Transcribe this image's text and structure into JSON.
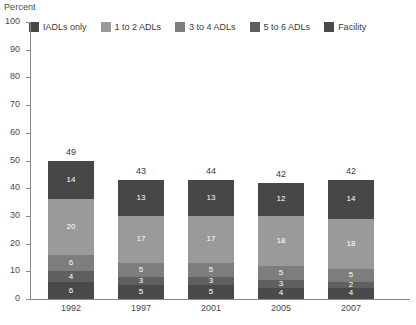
{
  "chart_data": {
    "type": "bar",
    "subtype": "stacked-bar",
    "title": "",
    "xlabel": "",
    "ylabel": "Percent",
    "ylim": [
      0,
      100
    ],
    "ytick_step": 10,
    "yticks": [
      100,
      90,
      80,
      70,
      60,
      50,
      40,
      30,
      20,
      10,
      0
    ],
    "grid": false,
    "legend_position": "top",
    "categories": [
      "1992",
      "1997",
      "2001",
      "2005",
      "2007"
    ],
    "totals": [
      49,
      43,
      44,
      42,
      42
    ],
    "series": [
      {
        "name": "Facility",
        "color": "#4a4a4a",
        "values": [
          6,
          5,
          5,
          4,
          4
        ]
      },
      {
        "name": "5 to 6 ADLs",
        "color": "#5f5f5f",
        "values": [
          4,
          3,
          3,
          3,
          2
        ]
      },
      {
        "name": "3 to 4 ADLs",
        "color": "#7d7d7d",
        "values": [
          6,
          5,
          5,
          5,
          5
        ]
      },
      {
        "name": "1 to 2 ADLs",
        "color": "#9a9a9a",
        "values": [
          20,
          17,
          17,
          18,
          18
        ]
      },
      {
        "name": "IADLs only",
        "color": "#474747",
        "values": [
          14,
          13,
          13,
          12,
          14
        ]
      }
    ]
  },
  "legend": {
    "items": [
      {
        "label": "IADLs only",
        "color": "#474747"
      },
      {
        "label": "1 to 2 ADLs",
        "color": "#9a9a9a"
      },
      {
        "label": "3 to 4 ADLs",
        "color": "#7d7d7d"
      },
      {
        "label": "5 to 6 ADLs",
        "color": "#5f5f5f"
      },
      {
        "label": "Facility",
        "color": "#4a4a4a"
      }
    ]
  },
  "axis": {
    "y_title": "Percent"
  }
}
